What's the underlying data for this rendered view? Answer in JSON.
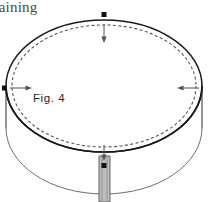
{
  "canvas": {
    "width": 209,
    "height": 202,
    "background": "#ffffff"
  },
  "header": {
    "clipped_text": "naining",
    "color": "#4a4a4a"
  },
  "figure": {
    "label": "Fig. 4",
    "label_color": "#262626",
    "stroke_dark": "#1a1a1a",
    "stroke_light": "#6e6e6e",
    "dash_color": "#555555",
    "marker_color": "#111111",
    "post_fill": "#bdbdbd",
    "post_edge": "#5a5a5a"
  },
  "geometry": {
    "top_ellipse": {
      "cx": 104,
      "cy": 86,
      "rx": 98,
      "ry": 66,
      "stroke_width": 1.6
    },
    "inner_dashed_ellipse": {
      "cx": 104,
      "cy": 86,
      "rx": 92,
      "ry": 61,
      "dash": "3 2.4"
    },
    "body_depth": 42,
    "post": {
      "x": 99,
      "y": 156,
      "width": 11,
      "height": 46
    }
  },
  "markers": [
    {
      "name": "top-dimension-marker",
      "x": 104,
      "y": 19,
      "arrow": "down"
    },
    {
      "name": "left-dimension-marker",
      "x": 6,
      "y": 88,
      "arrow": "right"
    },
    {
      "name": "right-dimension-marker",
      "x": 202,
      "y": 88,
      "arrow": "left"
    },
    {
      "name": "bottom-dimension-marker",
      "x": 104,
      "y": 170,
      "arrow": "down"
    }
  ]
}
